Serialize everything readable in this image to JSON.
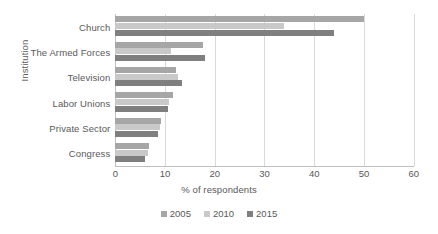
{
  "chart_data": {
    "type": "bar",
    "orientation": "horizontal",
    "title": "",
    "xlabel": "% of respondents",
    "ylabel": "Institution",
    "xlim": [
      0,
      60
    ],
    "xticks": [
      0,
      10,
      20,
      30,
      40,
      50,
      60
    ],
    "grid": true,
    "legend_position": "bottom",
    "categories": [
      "Church",
      "The Armed Forces",
      "Television",
      "Labor Unions",
      "Private Sector",
      "Congress"
    ],
    "series": [
      {
        "name": "2005",
        "color": "#a6a6a6",
        "values": [
          50,
          17.7,
          12.2,
          11.7,
          9.2,
          6.8
        ]
      },
      {
        "name": "2010",
        "color": "#c9c9c9",
        "values": [
          34,
          11.1,
          12.7,
          10.7,
          8.9,
          6.5
        ]
      },
      {
        "name": "2015",
        "color": "#7f7f7f",
        "values": [
          44,
          18.0,
          13.5,
          10.5,
          8.5,
          6.0
        ]
      }
    ]
  }
}
